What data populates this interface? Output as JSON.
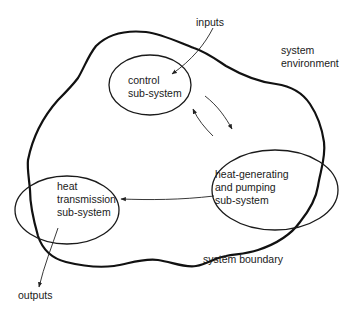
{
  "diagram": {
    "external": {
      "inputs": "inputs",
      "outputs": "outputs",
      "environment_line1": "system",
      "environment_line2": "environment",
      "boundary_label": "system boundary"
    },
    "subsystems": [
      {
        "id": "control",
        "lines": [
          "control",
          "sub-system"
        ]
      },
      {
        "id": "heat-generating",
        "lines": [
          "heat-generating",
          "and pumping",
          "sub-system"
        ]
      },
      {
        "id": "heat-transmission",
        "lines": [
          "heat",
          "transmission",
          "sub-system"
        ]
      }
    ],
    "flows": [
      {
        "from": "inputs",
        "to": "control"
      },
      {
        "from": "control",
        "to": "heat-generating"
      },
      {
        "from": "heat-generating",
        "to": "control"
      },
      {
        "from": "heat-generating",
        "to": "heat-transmission"
      },
      {
        "from": "heat-transmission",
        "to": "outputs"
      }
    ],
    "colors": {
      "line": "#111111",
      "background": "#ffffff"
    }
  }
}
